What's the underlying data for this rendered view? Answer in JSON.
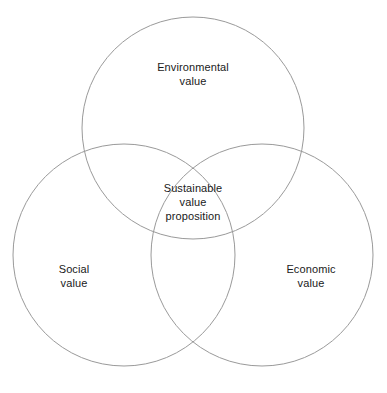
{
  "diagram": {
    "type": "venn-3-circle",
    "background_color": "#ffffff",
    "stroke_color": "#9a9a9a",
    "stroke_width": 1,
    "text_color": "#1a1a1a",
    "canvas": {
      "width": 387,
      "height": 393
    },
    "circles": [
      {
        "id": "environmental",
        "cx": 193,
        "cy": 128,
        "r": 111
      },
      {
        "id": "social",
        "cx": 124,
        "cy": 255,
        "r": 111
      },
      {
        "id": "economic",
        "cx": 262,
        "cy": 255,
        "r": 111
      }
    ],
    "labels": {
      "environmental": "Environmental\nvalue",
      "social": "Social\nvalue",
      "economic": "Economic\nvalue",
      "center": "Sustainable\nvalue\nproposition"
    }
  }
}
